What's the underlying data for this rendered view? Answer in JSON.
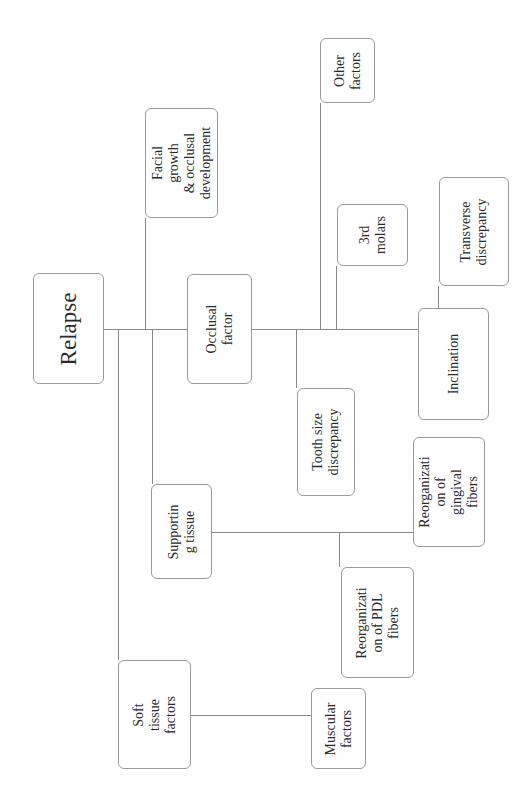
{
  "diagram": {
    "title": "Relapse",
    "orientation": "rotated 90° counter-clockwise",
    "nodes": {
      "relapse": "Relapse",
      "occlusal_factor": "Occlusal\nfactor",
      "facial_growth": "Facial growth\n& occlusal\ndevelopment",
      "other_factors": "Other\nfactors",
      "third_molars": "3rd\nmolars",
      "transverse_discrepancy": "Transverse\ndiscrepancy",
      "inclination": "Inclination",
      "tooth_size_discrepancy": "Tooth size\ndiscrepancy",
      "supporting_tissue": "Supportin\ng tissue",
      "reorg_gingival": "Reorganizati\non of\ngingival\nfibers",
      "reorg_pdl": "Reorganizati\non of PDL\nfibers",
      "soft_tissue_factors": "Soft tissue\nfactors",
      "muscular_factors": "Muscular\nfactors"
    },
    "edges": [
      [
        "Relapse",
        "Facial growth & occlusal development"
      ],
      [
        "Relapse",
        "Occlusal factor"
      ],
      [
        "Relapse",
        "Supporting tissue"
      ],
      [
        "Relapse",
        "Soft tissue factors"
      ],
      [
        "Occlusal factor",
        "Other factors"
      ],
      [
        "Occlusal factor",
        "3rd molars"
      ],
      [
        "Occlusal factor",
        "Tooth size discrepancy"
      ],
      [
        "Occlusal factor",
        "Inclination"
      ],
      [
        "Inclination",
        "Transverse discrepancy"
      ],
      [
        "Supporting tissue",
        "Reorganization of gingival fibers"
      ],
      [
        "Supporting tissue",
        "Reorganization of PDL fibers"
      ],
      [
        "Soft tissue factors",
        "Muscular factors"
      ]
    ]
  }
}
